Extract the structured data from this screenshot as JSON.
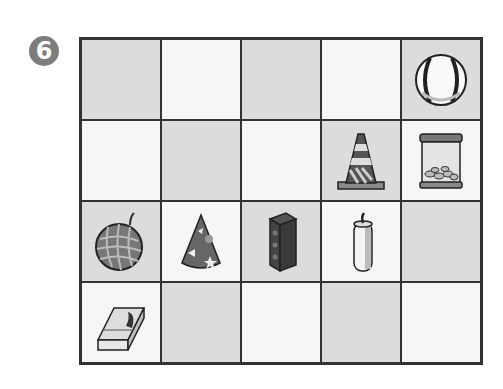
{
  "problem": {
    "number": "6",
    "badge_symbol": "❻"
  },
  "grid": {
    "rows": 4,
    "cols": 5,
    "cells": [
      [
        {
          "shade": "gray",
          "item": ""
        },
        {
          "shade": "white",
          "item": ""
        },
        {
          "shade": "gray",
          "item": ""
        },
        {
          "shade": "white",
          "item": ""
        },
        {
          "shade": "gray",
          "item": "baseball"
        }
      ],
      [
        {
          "shade": "white",
          "item": ""
        },
        {
          "shade": "gray",
          "item": ""
        },
        {
          "shade": "white",
          "item": ""
        },
        {
          "shade": "gray",
          "item": "traffic-cone"
        },
        {
          "shade": "white",
          "item": "peanut-jar"
        }
      ],
      [
        {
          "shade": "gray",
          "item": "melon"
        },
        {
          "shade": "white",
          "item": "party-hat"
        },
        {
          "shade": "gray",
          "item": "brick"
        },
        {
          "shade": "white",
          "item": "candle"
        },
        {
          "shade": "gray",
          "item": ""
        }
      ],
      [
        {
          "shade": "white",
          "item": "tissue-box"
        },
        {
          "shade": "gray",
          "item": ""
        },
        {
          "shade": "white",
          "item": ""
        },
        {
          "shade": "gray",
          "item": ""
        },
        {
          "shade": "white",
          "item": ""
        }
      ]
    ]
  },
  "colors": {
    "gray_cell": "#dcdcdc",
    "white_cell": "#f6f6f6",
    "grid_line": "#333333",
    "badge": "#7d7d7d"
  }
}
